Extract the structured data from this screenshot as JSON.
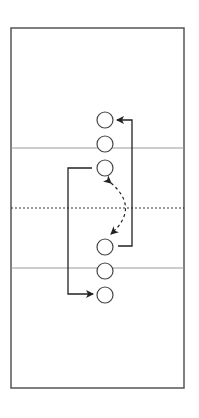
{
  "diagram": {
    "title": "Drill diagram: two columns of three players with crossing movement paths",
    "colors": {
      "background": "#ffffff",
      "court_border": "#555555",
      "court_lines": "#999999",
      "center_line": "#333333",
      "player": "#444444",
      "path": "#222222"
    },
    "court": {
      "x": 11,
      "y": 28,
      "width": 173,
      "height": 360
    },
    "lines": [
      {
        "id": "upper-line",
        "y": 148,
        "style": "solid"
      },
      {
        "id": "center-line",
        "y": 208,
        "style": "dotted"
      },
      {
        "id": "lower-line",
        "y": 268,
        "style": "solid"
      }
    ],
    "players": [
      {
        "id": "p1",
        "group": "top",
        "cx": 105,
        "cy": 120,
        "r": 8
      },
      {
        "id": "p2",
        "group": "top",
        "cx": 105,
        "cy": 144,
        "r": 8
      },
      {
        "id": "p3",
        "group": "top",
        "cx": 105,
        "cy": 168,
        "r": 8
      },
      {
        "id": "p4",
        "group": "bottom",
        "cx": 105,
        "cy": 247,
        "r": 8
      },
      {
        "id": "p5",
        "group": "bottom",
        "cx": 105,
        "cy": 271,
        "r": 8
      },
      {
        "id": "p6",
        "group": "bottom",
        "cx": 105,
        "cy": 295,
        "r": 8
      }
    ],
    "paths": [
      {
        "id": "left-run",
        "style": "solid",
        "from": "p3",
        "to": "p6",
        "description": "Runs left then down to behind bottom line"
      },
      {
        "id": "right-run",
        "style": "solid",
        "from": "p4",
        "to": "p1",
        "description": "Runs right then up to top of top line"
      },
      {
        "id": "pass",
        "style": "dashed",
        "from": "p3",
        "to": "p4",
        "description": "Two-way pass arc between lines"
      }
    ]
  }
}
